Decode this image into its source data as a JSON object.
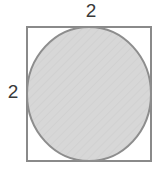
{
  "figure": {
    "background_color": "#ffffff",
    "square": {
      "name": "outer-square",
      "side_label": "2",
      "stroke_color": "#8a8a8a",
      "fill_color": "#ffffff",
      "stroke_width": 2,
      "x": 26,
      "y": 26,
      "width": 126,
      "height": 136
    },
    "circle": {
      "name": "inscribed-circle",
      "fill_color": "#d6d6d6",
      "stroke_color": "#8d8d8d",
      "stroke_width": 2,
      "cx": 89,
      "cy": 94,
      "rx": 62,
      "ry": 67
    },
    "labels": {
      "top": {
        "text": "2",
        "position": "top",
        "color": "#3a3a3a"
      },
      "left": {
        "text": "2",
        "position": "left",
        "color": "#3a3a3a"
      }
    }
  },
  "chart_data": {
    "type": "diagram",
    "shapes": [
      {
        "shape": "square",
        "side_length": 2,
        "label": "2",
        "labeled_sides": [
          "top",
          "left"
        ]
      },
      {
        "shape": "circle",
        "diameter": 2,
        "radius": 1,
        "inscribed_in": "square",
        "shaded": true
      }
    ],
    "annotations": [
      "2",
      "2"
    ]
  }
}
